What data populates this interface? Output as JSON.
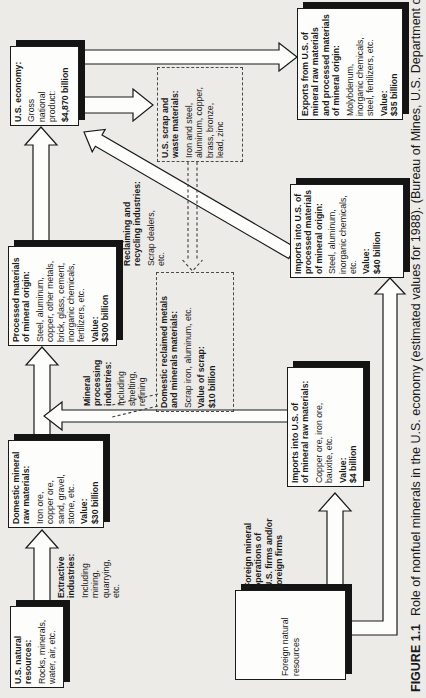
{
  "figure": {
    "caption_label": "FIGURE 1.1",
    "caption_text": "Role of nonfuel minerals in the U.S. economy (estimated values for 1988). (Bureau of Mines, U.S. Department of the"
  },
  "colors": {
    "background": "#edebe8",
    "ink": "#1a1a1a",
    "box_fill": "#fdfdfc",
    "shadow": "#141414"
  },
  "boxes": {
    "us_natural": {
      "title": "U.S. natural\nresources:",
      "body": "Rocks, minerals,\nwater, air, etc."
    },
    "domestic_raw": {
      "title": "Domestic mineral\nraw materials:",
      "body": "Iron ore,\ncopper ore,\nsand, gravel,\nstone, etc.",
      "value_label": "Value:",
      "value": "$30 billion"
    },
    "processed": {
      "title": "Processed materials\nof mineral origin:",
      "body": "Steel, aluminum,\ncopper, other metals,\nbrick, glass, cement,\ninorganic chemicals,\nfertilizers, etc.",
      "value_label": "Value:",
      "value": "$300 billion"
    },
    "us_economy": {
      "title": "U.S. economy:",
      "body": "Gross\nnational\nproduct:",
      "value": "$4,870 billion"
    },
    "exports": {
      "title": "Exports from U.S. of\nmineral raw materials\nand processed materials\nof mineral origin:",
      "body": "Molybdenum,\ninorganic chemicals,\nsteel, fertilizers, etc.",
      "value_label": "Value:",
      "value": "$35 billion"
    },
    "scrap": {
      "title": "U.S. scrap and\nwaste materials:",
      "body": "Iron and steel,\naluminum, copper,\nbrass, bronze,\nlead, zinc"
    },
    "reclaimed": {
      "title": "Domestic reclaimed metals\nand minerals materials:",
      "body": "Scrap iron, aluminum, etc.",
      "value_label": "Value of scrap:",
      "value": "$10 billion"
    },
    "imports_raw": {
      "title": "Imports into U.S. of\nof mineral raw materials:",
      "body": "Copper ore, iron ore,\nbauxite, etc.",
      "value_label": "Value:",
      "value": "$4 billion"
    },
    "imports_processed": {
      "title": "Imports into U.S. of\nprocessed materials\nof mineral origin:",
      "body": "Steel, aluminum,\ninorganic chemicals,\netc.",
      "value_label": "Value:",
      "value": "$40 billion"
    },
    "foreign_natural": {
      "title": "Foreign natural\nresources"
    }
  },
  "labels": {
    "extractive": {
      "title": "Extractive\nindustries:",
      "body": "Including\nmining,\nquarrying,\netc."
    },
    "processing": {
      "title": "Mineral\nprocessing\nindustries:",
      "body": "Including\nsmelting,\nrefining"
    },
    "reclaiming": {
      "title": "Reclaiming and\nrecycling industries:",
      "body": "Scrap dealers,\netc."
    },
    "foreign_ops": {
      "title": "Foreign mineral\noperations of\nU.S. firms and/or\nforeign firms"
    }
  }
}
